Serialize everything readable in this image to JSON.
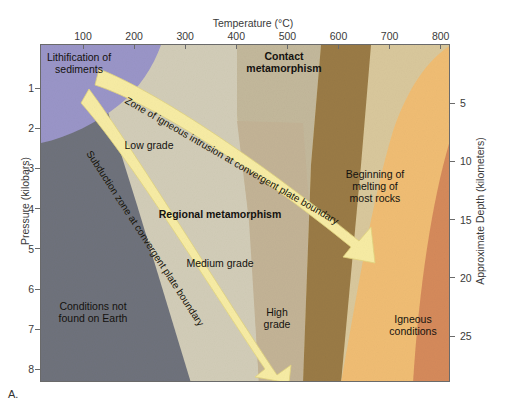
{
  "figure": {
    "panel_letter": "A.",
    "x_axis": {
      "title": "Temperature (°C)",
      "ticks": [
        100,
        200,
        300,
        400,
        500,
        600,
        700,
        800
      ],
      "range": [
        0,
        900
      ]
    },
    "y_axis_left": {
      "title": "Pressure (kilobars)",
      "ticks": [
        1,
        2,
        3,
        4,
        5,
        6,
        7,
        8
      ],
      "range": [
        0,
        8.4
      ]
    },
    "y_axis_right": {
      "title": "Approximate Depth (kilometers)",
      "ticks": [
        5,
        10,
        15,
        20,
        25
      ],
      "range": [
        0,
        29
      ]
    },
    "regions": [
      {
        "name": "lithification-of-sediments",
        "label": "Lithification of\nsediments",
        "bold": false,
        "color": "#9a95c8",
        "x": 78,
        "y": 62
      },
      {
        "name": "conditions-not-found-on-earth",
        "label": "Conditions not\nfound on Earth",
        "bold": false,
        "color": "#6f727c",
        "x": 92,
        "y": 311
      },
      {
        "name": "contact-metamorphism",
        "label": "Contact\nmetamorphism",
        "bold": true,
        "color": "#d9c89c",
        "x": 283,
        "y": 61
      },
      {
        "name": "low-grade",
        "label": "Low grade",
        "bold": false,
        "color": "#d2cdb8",
        "x": 148,
        "y": 144
      },
      {
        "name": "regional-metamorphism",
        "label": "Regional metamorphism",
        "bold": true,
        "color": "#c3b89b",
        "x": 219,
        "y": 213
      },
      {
        "name": "medium-grade",
        "label": "Medium grade",
        "bold": false,
        "color": "#c3b396",
        "x": 219,
        "y": 262
      },
      {
        "name": "high-grade",
        "label": "High\ngrade",
        "bold": false,
        "color": "#9a7b45",
        "x": 276,
        "y": 317
      },
      {
        "name": "beginning-of-melting-of-most-rocks",
        "label": "Beginning of\nmelting of\nmost rocks",
        "bold": false,
        "color": "#f0bd74",
        "x": 374,
        "y": 185
      },
      {
        "name": "igneous-conditions",
        "label": "Igneous\nconditions",
        "bold": false,
        "color": "#d58a5b",
        "x": 412,
        "y": 324
      }
    ],
    "bands": [
      {
        "name": "zone-of-igneous-intrusion-band",
        "label": "Zone of igneous intrusion at convergent plate boundary",
        "color": "#f7eca4",
        "x": 125,
        "y": 93,
        "angle": 30
      },
      {
        "name": "subduction-zone-band",
        "label": "Subduction zone at convergent plate boundary",
        "color": "#f7eca4",
        "x": 88,
        "y": 145,
        "angle": 57
      }
    ],
    "colors": {
      "plot_border": "#6a6a6a",
      "text": "#1a1a1a",
      "axis_text": "#3a3a3a",
      "background": "#ffffff"
    }
  }
}
